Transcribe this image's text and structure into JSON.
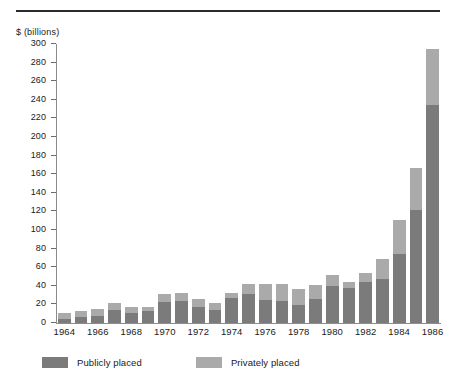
{
  "chart_data": {
    "type": "bar",
    "subtype": "stacked-vertical",
    "title": "",
    "subtitle": "",
    "xlabel": "",
    "ylabel": "$ (billions)",
    "ylim": [
      0,
      300
    ],
    "ytick_step": 20,
    "ytick_labels": [
      "300",
      "280",
      "260",
      "240",
      "220",
      "200",
      "180",
      "160",
      "140",
      "120",
      "100",
      "80",
      "60",
      "40",
      "20",
      "0"
    ],
    "ytick_values": [
      300,
      280,
      260,
      240,
      220,
      200,
      180,
      160,
      140,
      120,
      100,
      80,
      60,
      40,
      20,
      0
    ],
    "grid": false,
    "legend_position": "bottom-left",
    "categories": [
      "1964",
      "1965",
      "1966",
      "1967",
      "1968",
      "1969",
      "1970",
      "1971",
      "1972",
      "1973",
      "1974",
      "1975",
      "1976",
      "1977",
      "1978",
      "1979",
      "1980",
      "1981",
      "1982",
      "1983",
      "1984",
      "1985",
      "1986"
    ],
    "xtick_labels": [
      "1964",
      "1966",
      "1968",
      "1970",
      "1972",
      "1974",
      "1976",
      "1978",
      "1980",
      "1982",
      "1984",
      "1986"
    ],
    "xtick_indices": [
      0,
      2,
      4,
      6,
      8,
      10,
      12,
      14,
      16,
      18,
      20,
      22
    ],
    "series": [
      {
        "name": "Publicly placed",
        "color": "#7b7b7b",
        "values": [
          4,
          6,
          8,
          14,
          11,
          13,
          23,
          24,
          17,
          14,
          27,
          31,
          25,
          24,
          19,
          26,
          40,
          38,
          44,
          47,
          74,
          121,
          234
        ]
      },
      {
        "name": "Privately placed",
        "color": "#aaaaaa",
        "values": [
          7,
          7,
          7,
          7,
          6,
          4,
          8,
          8,
          9,
          8,
          5,
          11,
          17,
          18,
          18,
          15,
          12,
          6,
          10,
          22,
          37,
          46,
          61
        ]
      }
    ],
    "totals": [
      11,
      13,
      15,
      21,
      17,
      17,
      31,
      32,
      26,
      22,
      32,
      42,
      42,
      42,
      37,
      41,
      52,
      44,
      54,
      69,
      111,
      167,
      295
    ]
  },
  "legend": {
    "items": [
      {
        "label": "Publicly placed",
        "color": "#7b7b7b"
      },
      {
        "label": "Privately placed",
        "color": "#aaaaaa"
      }
    ]
  },
  "colors": {
    "public": "#7b7b7b",
    "private": "#aaaaaa",
    "axis": "#8c8c8c",
    "rule": "#2b2b2b",
    "text": "#1a1a1a",
    "background": "#ffffff"
  }
}
